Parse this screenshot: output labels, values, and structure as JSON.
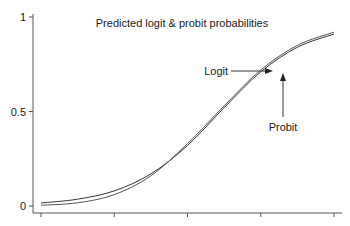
{
  "chart_data": {
    "type": "line",
    "title": "Predicted logit & probit probabilities",
    "xlabel": "",
    "ylabel": "",
    "ylim": [
      0,
      1
    ],
    "xlim": [
      0,
      4
    ],
    "y_ticks": [
      {
        "value": 0,
        "label": "0"
      },
      {
        "value": 0.5,
        "label": "0.5"
      },
      {
        "value": 1,
        "label": "1"
      }
    ],
    "x_ticks": [
      0,
      1,
      2,
      3,
      4
    ],
    "x_tick_labels_shown": false,
    "grid": false,
    "series": [
      {
        "name": "Logit",
        "x": [
          0,
          0.5,
          1,
          1.5,
          2,
          2.5,
          3,
          3.5,
          4
        ],
        "values": [
          0.016,
          0.036,
          0.08,
          0.17,
          0.32,
          0.52,
          0.71,
          0.84,
          0.91
        ]
      },
      {
        "name": "Probit",
        "x": [
          0,
          0.5,
          1,
          1.5,
          2,
          2.5,
          3,
          3.5,
          4
        ],
        "values": [
          0.004,
          0.017,
          0.06,
          0.16,
          0.33,
          0.53,
          0.72,
          0.85,
          0.92
        ]
      }
    ],
    "annotations": [
      {
        "text": "Logit",
        "points_to": "Logit",
        "at_x": 3.15,
        "direction": "right"
      },
      {
        "text": "Probit",
        "points_to": "Probit",
        "at_x": 3.3,
        "direction": "up"
      }
    ]
  }
}
